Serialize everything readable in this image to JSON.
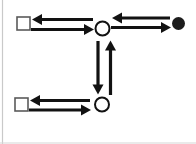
{
  "canvas": {
    "width": 196,
    "height": 144,
    "background": "#ffffff",
    "left_border_color": "#c9c9c9",
    "bottom_border_color": "#d6d6d6"
  },
  "palette": {
    "arrow_color": "#121212",
    "circle_stroke": "#121212",
    "square_stroke": "#5a5a5a",
    "filled_dot_fill": "#1d1d1d"
  },
  "style": {
    "arrow_shaft_width": 3.2,
    "arrow_head_length": 10,
    "arrow_head_half_width": 5.5,
    "circle_stroke_width": 2,
    "square_stroke_width": 1.6
  },
  "nodes": [
    {
      "id": "square-top-left",
      "shape": "square",
      "x": 23.5,
      "y": 23.5,
      "size": 13
    },
    {
      "id": "circle-top-center",
      "shape": "circle",
      "x": 102.5,
      "y": 28.5,
      "r": 7
    },
    {
      "id": "filled-dot-top-right",
      "shape": "filled-circle",
      "x": 178.5,
      "y": 23.5,
      "r": 6.5
    },
    {
      "id": "square-bottom-left",
      "shape": "square",
      "x": 21.5,
      "y": 104.5,
      "size": 13
    },
    {
      "id": "circle-bottom-center",
      "shape": "circle",
      "x": 102,
      "y": 104.5,
      "r": 7
    }
  ],
  "arrows": [
    {
      "id": "arrow-top-center-to-square-left",
      "x1": 93,
      "y1": 19.5,
      "x2": 32,
      "y2": 19.5
    },
    {
      "id": "arrow-square-left-to-top-center",
      "x1": 31,
      "y1": 29.5,
      "x2": 94,
      "y2": 29.5
    },
    {
      "id": "arrow-filled-dot-to-top-center",
      "x1": 170,
      "y1": 18,
      "x2": 112,
      "y2": 18
    },
    {
      "id": "arrow-top-center-to-filled-dot",
      "x1": 111,
      "y1": 27.5,
      "x2": 171,
      "y2": 27.5
    },
    {
      "id": "arrow-top-circle-to-bottom-circle",
      "x1": 98,
      "y1": 41,
      "x2": 98,
      "y2": 94.5
    },
    {
      "id": "arrow-bottom-circle-to-top-circle",
      "x1": 110.5,
      "y1": 95,
      "x2": 110.5,
      "y2": 40.5
    },
    {
      "id": "arrow-bottom-center-to-square",
      "x1": 90,
      "y1": 100.5,
      "x2": 30,
      "y2": 100.5
    },
    {
      "id": "arrow-square-to-bottom-center",
      "x1": 29,
      "y1": 110,
      "x2": 91,
      "y2": 110
    }
  ]
}
